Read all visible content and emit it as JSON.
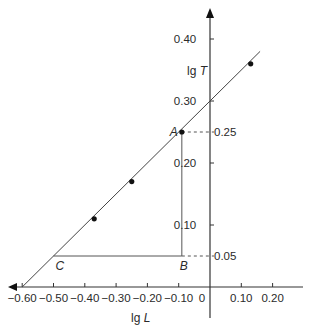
{
  "chart_data": {
    "type": "scatter",
    "title": "",
    "xlabel": "lg L",
    "ylabel": "lg T",
    "xlim": [
      -0.62,
      0.28
    ],
    "ylim": [
      0,
      0.44
    ],
    "grid": false,
    "legend": null,
    "x_ticks": [
      -0.6,
      -0.5,
      -0.4,
      -0.3,
      -0.2,
      -0.1,
      0,
      0.1,
      0.2
    ],
    "x_tick_labels": [
      "−0.60",
      "−0.50",
      "−0.40",
      "−0.30",
      "−0.20",
      "−0.10",
      "0",
      "0.10",
      "0.20"
    ],
    "y_ticks": [
      0.05,
      0.1,
      0.2,
      0.25,
      0.3,
      0.4
    ],
    "y_tick_labels": [
      "0.05",
      "0.10",
      "0.20",
      "0.25",
      "0.30",
      "0.40"
    ],
    "series": [
      {
        "name": "data points",
        "points": [
          {
            "x": -0.37,
            "y": 0.11
          },
          {
            "x": -0.25,
            "y": 0.17
          },
          {
            "x": -0.09,
            "y": 0.25
          },
          {
            "x": 0.13,
            "y": 0.36
          }
        ]
      }
    ],
    "fit_line": {
      "x0": -0.6,
      "y0": 0.0,
      "x1": 0.16,
      "y1": 0.38,
      "y_intercept": 0.3,
      "slope": 0.5
    },
    "annotations": [
      {
        "label": "A",
        "x": -0.09,
        "y": 0.25
      },
      {
        "label": "B",
        "x": -0.09,
        "y": 0.05
      },
      {
        "label": "C",
        "x": -0.5,
        "y": 0.05
      }
    ],
    "guide_lines": [
      {
        "style": "dashed",
        "from": [
          -0.09,
          0.25
        ],
        "to": [
          0,
          0.25
        ]
      },
      {
        "style": "dashed",
        "from": [
          -0.09,
          0.05
        ],
        "to": [
          0,
          0.05
        ]
      },
      {
        "style": "solid",
        "from": [
          -0.09,
          0.25
        ],
        "to": [
          -0.09,
          0.05
        ]
      },
      {
        "style": "solid",
        "from": [
          -0.5,
          0.05
        ],
        "to": [
          -0.09,
          0.05
        ]
      }
    ]
  }
}
